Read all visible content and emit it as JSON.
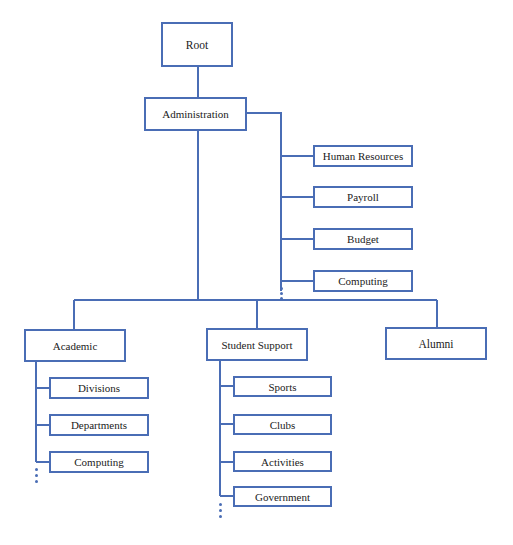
{
  "diagram": {
    "type": "org-chart-tree",
    "line_color": "#4a6db5",
    "root": {
      "label": "Root"
    },
    "administration": {
      "label": "Administration",
      "children": [
        "Human Resources",
        "Payroll",
        "Budget",
        "Computing"
      ],
      "more_indicator": "⋮"
    },
    "level2": [
      {
        "label": "Academic",
        "children": [
          "Divisions",
          "Departments",
          "Computing"
        ],
        "more_indicator": "⋮"
      },
      {
        "label": "Student Support",
        "children": [
          "Sports",
          "Clubs",
          "Activities",
          "Government"
        ],
        "more_indicator": "⋮"
      },
      {
        "label": "Alumni",
        "children": []
      }
    ]
  }
}
